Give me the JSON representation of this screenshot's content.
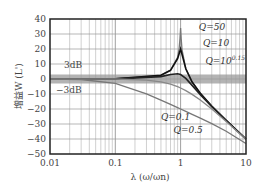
{
  "chart_data": {
    "type": "line",
    "title": "",
    "xlabel": "λ (ω/ωn)",
    "ylabel": "增益W (L')",
    "xscale": "log",
    "xlim": [
      0.01,
      10
    ],
    "ylim": [
      -50,
      40
    ],
    "grid": true,
    "x_ticks": [
      "0.01",
      "0.1",
      "1",
      "10"
    ],
    "y_ticks": [
      "40",
      "30",
      "20",
      "10",
      "0",
      "−10",
      "−20",
      "−30",
      "−40",
      "−50"
    ],
    "band": {
      "from": -3,
      "to": 3,
      "upper_label": "3dB",
      "lower_label": "−3dB"
    },
    "series": [
      {
        "name": "Q=50",
        "color": "#777777",
        "x": [
          0.01,
          0.1,
          0.5,
          0.7,
          0.9,
          0.95,
          0.98,
          1,
          1.02,
          1.05,
          1.2,
          1.5,
          2,
          3,
          5,
          10
        ],
        "y": [
          0,
          0.09,
          2.5,
          5.8,
          14.4,
          20.1,
          27.1,
          34,
          26.9,
          19.6,
          6.9,
          -1.9,
          -9.5,
          -18,
          -27.6,
          -40
        ]
      },
      {
        "name": "Q=10",
        "color": "#111111",
        "x": [
          0.01,
          0.1,
          0.5,
          0.7,
          0.9,
          1,
          1.2,
          1.5,
          2,
          3,
          5,
          10
        ],
        "y": [
          0,
          0.09,
          2.48,
          5.77,
          13.56,
          20,
          6.82,
          -2,
          -9.55,
          -18.1,
          -27.6,
          -40
        ]
      },
      {
        "name": "Q=10^0.15",
        "color": "#222222",
        "x": [
          0.01,
          0.1,
          0.5,
          0.7,
          0.9,
          1,
          1.2,
          1.5,
          2,
          3,
          5,
          10
        ],
        "y": [
          0,
          0.07,
          1.63,
          2.97,
          3.56,
          3.01,
          0.39,
          -4.29,
          -10.4,
          -18.4,
          -27.7,
          -40
        ]
      },
      {
        "name": "Q=0.5",
        "color": "#888888",
        "x": [
          0.01,
          0.1,
          0.3,
          0.5,
          0.7,
          0.9,
          1,
          1.2,
          1.5,
          2,
          3,
          5,
          10
        ],
        "y": [
          0,
          0,
          -0.75,
          -1.94,
          -3.46,
          -5.15,
          -6.02,
          -7.75,
          -10.24,
          -13.98,
          -20,
          -28.3,
          -40.1
        ]
      },
      {
        "name": "Q=0.1",
        "color": "#777777",
        "x": [
          0.01,
          0.03,
          0.1,
          0.3,
          0.5,
          0.7,
          0.9,
          1,
          1.2,
          1.5,
          2,
          3,
          5,
          10
        ],
        "y": [
          -0.04,
          -0.35,
          -2.92,
          -9.93,
          -14.08,
          -16.93,
          -19.09,
          -20,
          -21.59,
          -23.6,
          -26.1,
          -29.8,
          -34.9,
          -43
        ]
      }
    ],
    "annotations": [
      {
        "text": "Q=50",
        "x": 1.9,
        "y": 33
      },
      {
        "text": "Q=10",
        "x": 2.2,
        "y": 22
      },
      {
        "text": "Q=10",
        "sup": "0.15",
        "x": 2.4,
        "y": 10
      },
      {
        "text": "Q=0.1",
        "x": 0.5,
        "y": -27
      },
      {
        "text": "Q=0.5",
        "x": 0.78,
        "y": -36
      }
    ]
  }
}
